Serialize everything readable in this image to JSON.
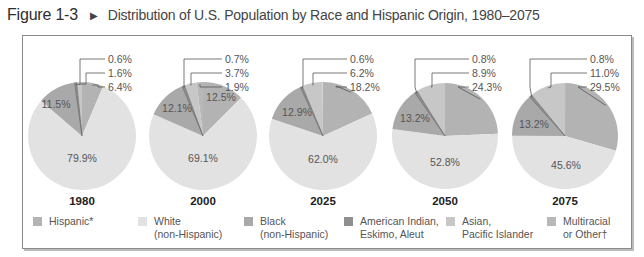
{
  "figure": {
    "number": "Figure 1-3",
    "arrow_icon": "▶",
    "title": "Distribution of U.S. Population by Race and Hispanic Origin, 1980–2075"
  },
  "colors": {
    "hispanic": "#b3b3b3",
    "white": "#e2e2e2",
    "black": "#a9a9a9",
    "american_indian": "#8f8f8f",
    "asian": "#c7c7c7",
    "multiracial": "#b8b8b8",
    "edge": "#6e6e6e"
  },
  "legend": [
    {
      "key": "hispanic",
      "line1": "Hispanic*",
      "line2": ""
    },
    {
      "key": "white",
      "line1": "White",
      "line2": "(non-Hispanic)"
    },
    {
      "key": "black",
      "line1": "Black",
      "line2": "(non-Hispanic)"
    },
    {
      "key": "american_indian",
      "line1": "American Indian,",
      "line2": "Eskimo, Aleut"
    },
    {
      "key": "asian",
      "line1": "Asian,",
      "line2": "Pacific Islander"
    },
    {
      "key": "multiracial",
      "line1": "Multiracial",
      "line2": "or Other†"
    }
  ],
  "chart_data": {
    "type": "pie",
    "title": "Distribution of U.S. Population by Race and Hispanic Origin, 1980–2075",
    "categories": [
      "Hispanic*",
      "White (non-Hispanic)",
      "Black (non-Hispanic)",
      "American Indian, Eskimo, Aleut",
      "Asian, Pacific Islander",
      "Multiracial or Other†"
    ],
    "unit": "%",
    "pies": [
      {
        "year": "1980",
        "values": {
          "hispanic": 6.4,
          "white": 79.9,
          "black": 11.5,
          "american_indian": 0.6,
          "asian": 1.6,
          "multiracial": 0
        }
      },
      {
        "year": "2000",
        "values": {
          "hispanic": 12.5,
          "white": 69.1,
          "black": 12.1,
          "american_indian": 0.7,
          "asian": 3.7,
          "multiracial": 1.9
        }
      },
      {
        "year": "2025",
        "values": {
          "hispanic": 18.2,
          "white": 62.0,
          "black": 12.9,
          "american_indian": 0.6,
          "asian": 6.2,
          "multiracial": 0
        }
      },
      {
        "year": "2050",
        "values": {
          "hispanic": 24.3,
          "white": 52.8,
          "black": 13.2,
          "american_indian": 0.8,
          "asian": 8.9,
          "multiracial": 0
        }
      },
      {
        "year": "2075",
        "values": {
          "hispanic": 29.5,
          "white": 45.6,
          "black": 13.2,
          "american_indian": 0.8,
          "asian": 11.0,
          "multiracial": 0
        }
      }
    ],
    "legend_position": "bottom"
  },
  "layout": {
    "pies": [
      {
        "cx": 82,
        "cy": 136,
        "r": 54,
        "inside": [
          {
            "key": "white",
            "label": "79.9%",
            "x": 82,
            "y": 162
          },
          {
            "key": "black",
            "label": "11.5%",
            "x": 56,
            "y": 108
          }
        ],
        "callouts": [
          {
            "key": "american_indian",
            "label": "0.6%",
            "y": 62,
            "lx": 80
          },
          {
            "key": "asian",
            "label": "1.6%",
            "y": 76,
            "lx": 86
          },
          {
            "key": "hispanic",
            "label": "6.4%",
            "y": 90,
            "lx": 98
          }
        ],
        "textx": 108
      },
      {
        "cx": 203,
        "cy": 136,
        "r": 54,
        "inside": [
          {
            "key": "white",
            "label": "69.1%",
            "x": 203,
            "y": 162
          },
          {
            "key": "black",
            "label": "12.1%",
            "x": 177,
            "y": 112
          },
          {
            "key": "hispanic",
            "label": "12.5%",
            "x": 221,
            "y": 101
          }
        ],
        "callouts": [
          {
            "key": "american_indian",
            "label": "0.7%",
            "y": 62,
            "lx": 184
          },
          {
            "key": "asian",
            "label": "3.7%",
            "y": 76,
            "lx": 191
          },
          {
            "key": "multiracial",
            "label": "1.9%",
            "y": 90,
            "lx": 200
          }
        ],
        "textx": 225
      },
      {
        "cx": 323,
        "cy": 136,
        "r": 54,
        "inside": [
          {
            "key": "white",
            "label": "62.0%",
            "x": 323,
            "y": 163
          },
          {
            "key": "black",
            "label": "12.9%",
            "x": 297,
            "y": 116
          }
        ],
        "callouts": [
          {
            "key": "american_indian",
            "label": "0.6%",
            "y": 62,
            "lx": 303
          },
          {
            "key": "asian",
            "label": "6.2%",
            "y": 76,
            "lx": 313
          },
          {
            "key": "hispanic",
            "label": "18.2%",
            "y": 90,
            "lx": 336
          }
        ],
        "textx": 350
      },
      {
        "cx": 445,
        "cy": 136,
        "r": 53,
        "inside": [
          {
            "key": "white",
            "label": "52.8%",
            "x": 445,
            "y": 166
          },
          {
            "key": "black",
            "label": "13.2%",
            "x": 415,
            "y": 122
          }
        ],
        "callouts": [
          {
            "key": "american_indian",
            "label": "0.8%",
            "y": 62,
            "lx": 415
          },
          {
            "key": "asian",
            "label": "8.9%",
            "y": 76,
            "lx": 432
          },
          {
            "key": "hispanic",
            "label": "24.3%",
            "y": 90,
            "lx": 458
          }
        ],
        "textx": 472
      },
      {
        "cx": 565,
        "cy": 136,
        "r": 53,
        "inside": [
          {
            "key": "white",
            "label": "45.6%",
            "x": 566,
            "y": 169
          },
          {
            "key": "black",
            "label": "13.2%",
            "x": 534,
            "y": 128
          }
        ],
        "callouts": [
          {
            "key": "american_indian",
            "label": "0.8%",
            "y": 62,
            "lx": 530
          },
          {
            "key": "asian",
            "label": "11.0%",
            "y": 76,
            "lx": 551
          },
          {
            "key": "hispanic",
            "label": "29.5%",
            "y": 90,
            "lx": 578
          }
        ],
        "textx": 590
      }
    ],
    "legend_x": [
      33,
      138,
      244,
      344,
      446,
      547
    ]
  }
}
